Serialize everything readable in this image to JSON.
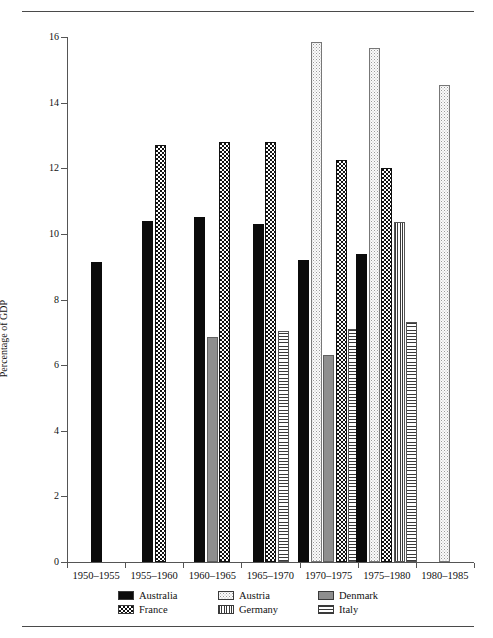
{
  "chart_data": {
    "type": "bar",
    "title": "",
    "xlabel": "",
    "ylabel": "Percentage of GDP",
    "ylim": [
      0,
      16
    ],
    "ytick_values": [
      0,
      2,
      4,
      6,
      8,
      10,
      12,
      14,
      16
    ],
    "ytick_labels": [
      "0",
      "2",
      "4",
      "6",
      "8",
      "10",
      "12",
      "14",
      "16"
    ],
    "grid": false,
    "legend_position": "bottom",
    "categories": [
      "1950–1955",
      "1955–1960",
      "1960–1965",
      "1965–1970",
      "1970–1975",
      "1975–1980",
      "1980–1985"
    ],
    "series": [
      {
        "name": "Australia",
        "pattern": "solid-black",
        "color": "#0b0b0b",
        "values": [
          9.15,
          10.4,
          10.5,
          10.3,
          9.2,
          9.4,
          null
        ]
      },
      {
        "name": "Austria",
        "pattern": "light-stipple",
        "color": "#fbfbfb",
        "values": [
          null,
          null,
          null,
          null,
          15.85,
          15.65,
          14.55
        ]
      },
      {
        "name": "Denmark",
        "pattern": "solid-gray",
        "color": "#8e8e8e",
        "values": [
          null,
          null,
          6.85,
          null,
          6.3,
          null,
          null
        ]
      },
      {
        "name": "France",
        "pattern": "checkerboard",
        "color": "#111111",
        "values": [
          null,
          12.7,
          12.8,
          12.8,
          12.25,
          12.0,
          null
        ]
      },
      {
        "name": "Germany",
        "pattern": "vertical-stripes",
        "color": "#3a3a3a",
        "values": [
          null,
          null,
          null,
          null,
          null,
          10.35,
          null
        ]
      },
      {
        "name": "Italy",
        "pattern": "horizontal-stripes",
        "color": "#3a3a3a",
        "values": [
          null,
          null,
          null,
          7.05,
          7.1,
          7.3,
          null
        ]
      }
    ]
  },
  "legend": {
    "items": [
      {
        "label": "Australia",
        "key": "australia"
      },
      {
        "label": "Austria",
        "key": "austria"
      },
      {
        "label": "Denmark",
        "key": "denmark"
      },
      {
        "label": "France",
        "key": "france"
      },
      {
        "label": "Germany",
        "key": "germany"
      },
      {
        "label": "Italy",
        "key": "italy"
      }
    ]
  }
}
